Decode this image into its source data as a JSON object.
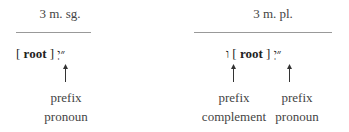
{
  "columns": [
    {
      "heading": "3 m. sg.",
      "formula": {
        "open": "[",
        "root": "root",
        "close": "]",
        "suffix": "״יְ"
      },
      "labels": [
        {
          "line1": "prefix",
          "line2": "pronoun"
        }
      ]
    },
    {
      "heading": "3 m. pl.",
      "formula": {
        "prefix": "ו",
        "open": "[",
        "root": "root",
        "close": "]",
        "suffix": "״יְ"
      },
      "labels": [
        {
          "line1": "prefix",
          "line2": "complement"
        },
        {
          "line1": "prefix",
          "line2": "pronoun"
        }
      ]
    }
  ]
}
